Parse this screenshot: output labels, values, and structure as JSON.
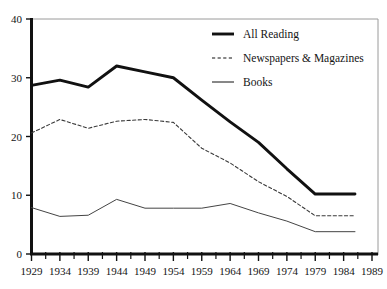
{
  "chart_data": {
    "type": "line",
    "title": "",
    "xlabel": "",
    "ylabel": "",
    "xlim": [
      1929,
      1989
    ],
    "ylim": [
      0,
      40
    ],
    "grid": false,
    "legend_position": "top-right",
    "x": [
      1929,
      1934,
      1939,
      1944,
      1949,
      1954,
      1959,
      1964,
      1969,
      1974,
      1979,
      1984,
      1986
    ],
    "xticklabels": [
      "1929",
      "1934",
      "1939",
      "1944",
      "1949",
      "1954",
      "1959",
      "1964",
      "1969",
      "1974",
      "1979",
      "1984",
      "1989"
    ],
    "xtickvalues": [
      1929,
      1934,
      1939,
      1944,
      1949,
      1954,
      1959,
      1964,
      1969,
      1974,
      1979,
      1984,
      1989
    ],
    "xminortickvalues": [
      1931.5,
      1936.5,
      1941.5,
      1946.5,
      1951.5,
      1956.5,
      1961.5,
      1966.5,
      1971.5,
      1976.5,
      1981.5,
      1986.5
    ],
    "yticklabels": [
      "0",
      "10",
      "20",
      "30",
      "40"
    ],
    "ytickvalues": [
      0,
      10,
      20,
      30,
      40
    ],
    "series": [
      {
        "name": "All Reading",
        "style": "solid-thick",
        "color": "#111111",
        "x": [
          1929,
          1934,
          1939,
          1944,
          1949,
          1954,
          1959,
          1964,
          1969,
          1974,
          1979,
          1986
        ],
        "values": [
          28.7,
          29.6,
          28.4,
          32.0,
          31.0,
          30.0,
          26.2,
          22.5,
          19.0,
          14.5,
          10.2,
          10.2
        ]
      },
      {
        "name": "Newspapers & Magazines",
        "style": "dashed",
        "color": "#3a3a3a",
        "x": [
          1929,
          1934,
          1939,
          1944,
          1949,
          1954,
          1959,
          1964,
          1969,
          1974,
          1979,
          1986
        ],
        "values": [
          20.6,
          22.9,
          21.4,
          22.6,
          22.9,
          22.4,
          18.0,
          15.5,
          12.3,
          9.8,
          6.5,
          6.5
        ]
      },
      {
        "name": "Books",
        "style": "solid-thin",
        "color": "#444444",
        "x": [
          1929,
          1934,
          1939,
          1944,
          1949,
          1954,
          1959,
          1964,
          1969,
          1974,
          1979,
          1986
        ],
        "values": [
          7.9,
          6.4,
          6.6,
          9.3,
          7.8,
          7.8,
          7.8,
          8.6,
          7.0,
          5.6,
          3.8,
          3.8
        ]
      }
    ],
    "legend": [
      {
        "label": "All Reading",
        "style": "solid-thick"
      },
      {
        "label": "Newspapers & Magazines",
        "style": "dashed"
      },
      {
        "label": "Books",
        "style": "solid-thin"
      }
    ]
  }
}
